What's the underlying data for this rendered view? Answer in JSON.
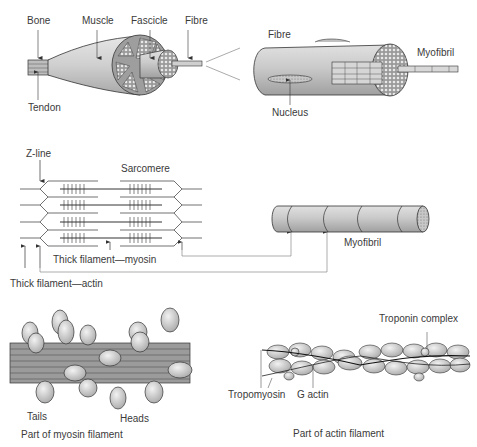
{
  "panel_muscle": {
    "labels": {
      "bone": "Bone",
      "muscle": "Muscle",
      "fascicle": "Fascicle",
      "fibre": "Fibre",
      "tendon": "Tendon"
    }
  },
  "panel_fibre": {
    "labels": {
      "fibre": "Fibre",
      "myofibril": "Myofibril",
      "nucleus": "Nucleus"
    }
  },
  "panel_sarcomere": {
    "labels": {
      "z_line": "Z-line",
      "sarcomere": "Sarcomere",
      "thick_myosin": "Thick filament—myosin",
      "thick_actin": "Thick filament—actin"
    }
  },
  "panel_myofibril": {
    "labels": {
      "myofibril": "Myofibril"
    }
  },
  "panel_myosin": {
    "labels": {
      "tails": "Tails",
      "heads": "Heads",
      "caption": "Part of myosin filament"
    }
  },
  "panel_actin": {
    "labels": {
      "troponin": "Troponin complex",
      "tropomyosin": "Tropomyosin",
      "g_actin": "G actin",
      "caption": "Part of actin filament"
    }
  },
  "colors": {
    "fill_light": "#d9d9d9",
    "fill_mid": "#bdbdbd",
    "fill_dark": "#8c8c8c",
    "stroke": "#333333",
    "text": "#3a3a3a"
  }
}
